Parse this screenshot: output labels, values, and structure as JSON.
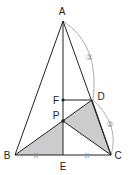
{
  "diagram": {
    "points": {
      "A": {
        "label": "A",
        "x": 63,
        "y": 21
      },
      "B": {
        "label": "B",
        "x": 15,
        "y": 155
      },
      "C": {
        "label": "C",
        "x": 111,
        "y": 155
      },
      "D": {
        "label": "D",
        "x": 92,
        "y": 100
      },
      "E": {
        "label": "E",
        "x": 63,
        "y": 155
      },
      "F": {
        "label": "F",
        "x": 63,
        "y": 100
      },
      "P": {
        "label": "P",
        "x": 63,
        "y": 121
      }
    },
    "ratio_labels": {
      "AD": "③",
      "DC": "②"
    },
    "tick_marks": {
      "BE": "ıı",
      "EC": "ıı"
    },
    "shaded_regions": [
      "triangle BEP",
      "quadrilateral PDC"
    ],
    "colors": {
      "line": "#222222",
      "shade": "#cccccc",
      "arc": "#999999"
    }
  }
}
